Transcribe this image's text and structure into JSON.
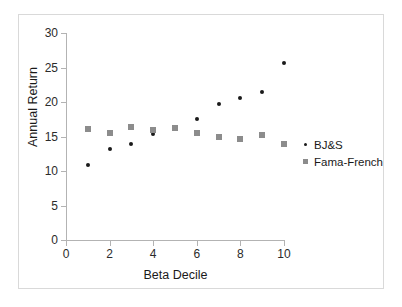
{
  "chart_data": {
    "type": "scatter",
    "title": "",
    "xlabel": "Beta Decile",
    "ylabel": "Annual Return",
    "xlim": [
      0,
      10
    ],
    "ylim": [
      0,
      30
    ],
    "xticks": [
      0,
      2,
      4,
      6,
      8,
      10
    ],
    "yticks": [
      0,
      5,
      10,
      15,
      20,
      25,
      30
    ],
    "xtick_labels": [
      "0",
      "2",
      "4",
      "6",
      "8",
      "10"
    ],
    "ytick_labels": [
      "0",
      "5",
      "10",
      "15",
      "20",
      "25",
      "30"
    ],
    "grid": false,
    "legend_position": "right",
    "x": [
      1,
      2,
      3,
      4,
      5,
      6,
      7,
      8,
      9,
      10
    ],
    "series": [
      {
        "name": "BJ&S",
        "marker": "circle",
        "color": "#1a1a1a",
        "values": [
          10.9,
          13.2,
          13.9,
          15.3,
          16.4,
          17.5,
          19.7,
          20.6,
          21.4,
          25.7
        ]
      },
      {
        "name": "Fama-French",
        "marker": "square",
        "color": "#8c8c8c",
        "values": [
          16.1,
          15.5,
          16.4,
          16.0,
          16.2,
          15.5,
          15.0,
          14.7,
          15.2,
          13.9
        ]
      }
    ]
  },
  "legend": {
    "entries": [
      {
        "label": "BJ&S",
        "marker_name": "legend-marker-dot"
      },
      {
        "label": "Fama-French",
        "marker_name": "legend-marker-square"
      }
    ]
  },
  "colors": {
    "bjs": "#1a1a1a",
    "fama_french": "#8c8c8c",
    "axis": "#b3b3b3",
    "frame": "#d9d9d9",
    "background": "#ffffff",
    "text": "#1a1a1a"
  }
}
